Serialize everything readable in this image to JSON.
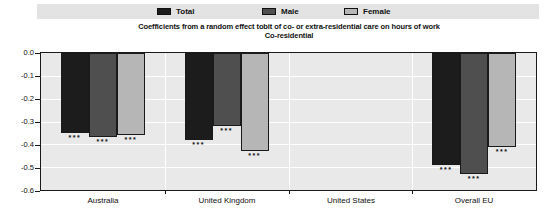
{
  "title": "Coefficients from a random effect tobit of co- or extra-residential care on hours of work",
  "subtitle": "Co-residential",
  "legend": {
    "position": "top",
    "items": [
      {
        "label": "Total",
        "color": "#1c1c1c"
      },
      {
        "label": "Male",
        "color": "#4f4f4f"
      },
      {
        "label": "Female",
        "color": "#b6b6b6"
      }
    ]
  },
  "chart_data": {
    "type": "bar",
    "title": "Coefficients from a random effect tobit of co- or extra-residential care on hours of work",
    "subtitle": "Co-residential",
    "categories": [
      "Australia",
      "United Kingdom",
      "United States",
      "Overall EU"
    ],
    "series": [
      {
        "name": "Total",
        "color": "#1c1c1c",
        "values": [
          -0.35,
          -0.38,
          null,
          -0.49
        ]
      },
      {
        "name": "Male",
        "color": "#4f4f4f",
        "values": [
          -0.37,
          -0.32,
          null,
          -0.53
        ]
      },
      {
        "name": "Female",
        "color": "#b6b6b6",
        "values": [
          -0.36,
          -0.43,
          null,
          -0.41
        ]
      }
    ],
    "significance_labels": [
      [
        "***",
        "***",
        null,
        "***"
      ],
      [
        "***",
        "***",
        null,
        "***"
      ],
      [
        "***",
        "***",
        null,
        "***"
      ]
    ],
    "ylim": [
      -0.6,
      0.0
    ],
    "yticks": [
      0.0,
      -0.1,
      -0.2,
      -0.3,
      -0.4,
      -0.5,
      -0.6
    ],
    "ytick_labels": [
      "0.0",
      "-0.1",
      "-0.2",
      "-0.3",
      "-0.4",
      "-0.5",
      "-0.6"
    ],
    "grid": true,
    "grid_color": "#ffffff",
    "plot_background": "#e9e9e9",
    "legend_position": "top"
  }
}
